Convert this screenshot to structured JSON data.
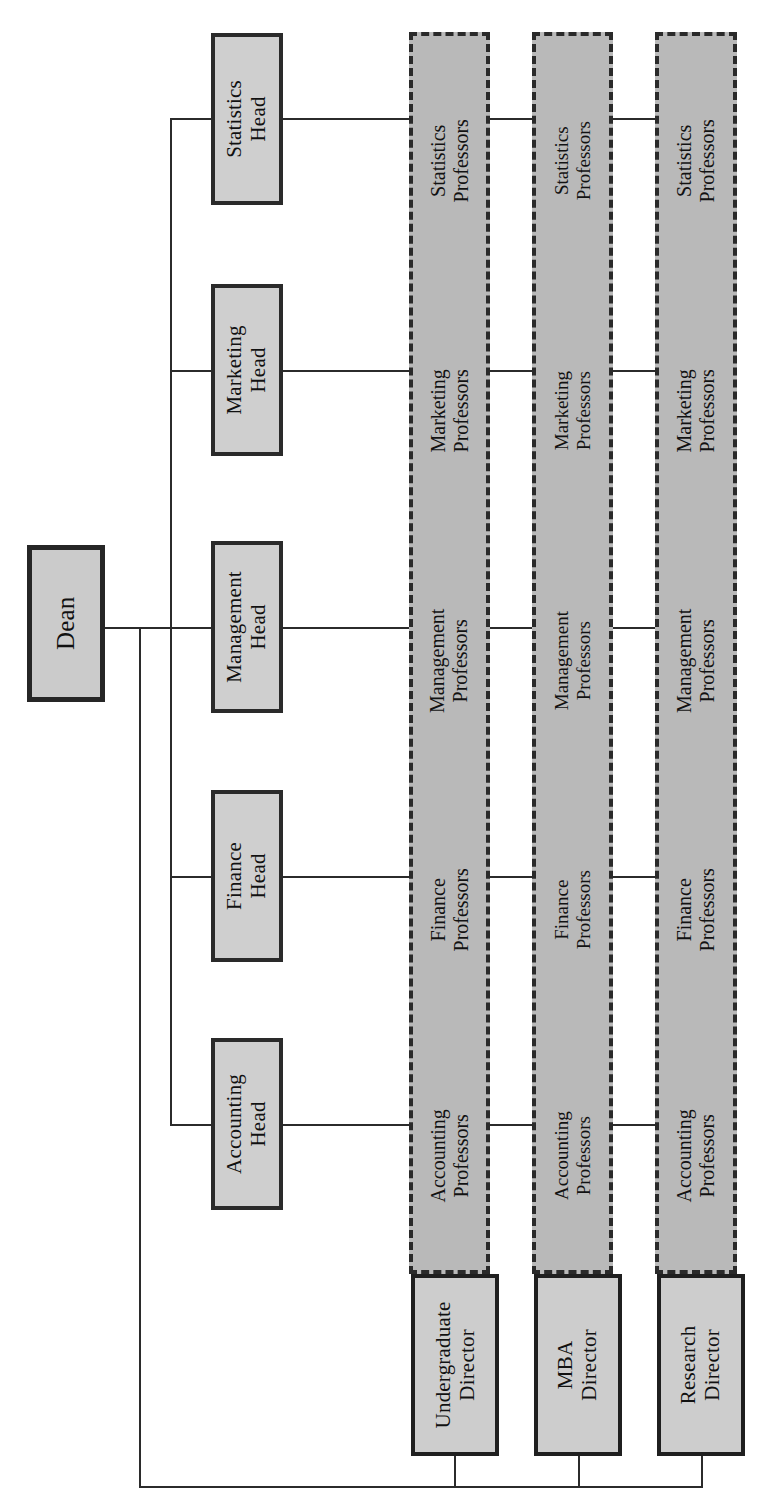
{
  "diagram": {
    "type": "matrix-org-chart",
    "orientation": "rotated-90-ccw",
    "colors": {
      "box_fill": "#cfcfcf",
      "column_fill": "#b9b9b9",
      "border": "#2a2a2a",
      "line": "#2b2b2b",
      "background": "#ffffff"
    }
  },
  "dean": {
    "label": "Dean"
  },
  "department_heads": [
    {
      "label": "Accounting\nHead",
      "line1": "Accounting",
      "line2": "Head"
    },
    {
      "label": "Finance\nHead",
      "line1": "Finance",
      "line2": "Head"
    },
    {
      "label": "Management\nHead",
      "line1": "Management",
      "line2": "Head"
    },
    {
      "label": "Marketing\nHead",
      "line1": "Marketing",
      "line2": "Head"
    },
    {
      "label": "Statistics\nHead",
      "line1": "Statistics",
      "line2": "Head"
    }
  ],
  "program_directors": [
    {
      "label": "Undergraduate\nDirector",
      "line1": "Undergraduate",
      "line2": "Director"
    },
    {
      "label": "MBA\nDirector",
      "line1": "MBA",
      "line2": "Director"
    },
    {
      "label": "Research\nDirector",
      "line1": "Research",
      "line2": "Director"
    }
  ],
  "professor_groups": [
    {
      "program": "Undergraduate",
      "cells": [
        {
          "line1": "Accounting",
          "line2": "Professors"
        },
        {
          "line1": "Finance",
          "line2": "Professors"
        },
        {
          "line1": "Management",
          "line2": "Professors"
        },
        {
          "line1": "Marketing",
          "line2": "Professors"
        },
        {
          "line1": "Statistics",
          "line2": "Professors"
        }
      ]
    },
    {
      "program": "MBA",
      "cells": [
        {
          "line1": "Accounting",
          "line2": "Professors"
        },
        {
          "line1": "Finance",
          "line2": "Professors"
        },
        {
          "line1": "Management",
          "line2": "Professors"
        },
        {
          "line1": "Marketing",
          "line2": "Professors"
        },
        {
          "line1": "Statistics",
          "line2": "Professors"
        }
      ]
    },
    {
      "program": "Research",
      "cells": [
        {
          "line1": "Accounting",
          "line2": "Professors"
        },
        {
          "line1": "Finance",
          "line2": "Professors"
        },
        {
          "line1": "Management",
          "line2": "Professors"
        },
        {
          "line1": "Marketing",
          "line2": "Professors"
        },
        {
          "line1": "Statistics",
          "line2": "Professors"
        }
      ]
    }
  ]
}
